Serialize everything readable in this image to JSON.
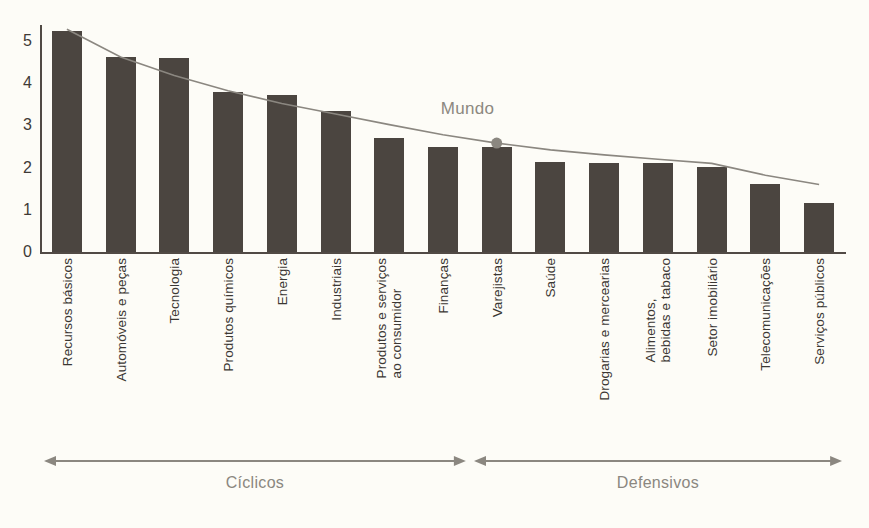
{
  "chart_data": {
    "type": "bar",
    "title": "",
    "subtitle": "",
    "xlabel": "",
    "ylabel": "",
    "ylim": [
      0,
      5.4
    ],
    "yticks": [
      "0",
      "1",
      "2",
      "3",
      "4",
      "5"
    ],
    "ytick_values": [
      0,
      1,
      2,
      3,
      4,
      5
    ],
    "grid": false,
    "legend_position": "inline-annotation",
    "categories": [
      "Recursos básicos",
      "Automóveis e peças",
      "Tecnologia",
      "Produtos químicos",
      "Energia",
      "Industriais",
      "Produtos e serviços\nao consumidor",
      "Finanças",
      "Varejistas",
      "Saúde",
      "Drogarias e mercearias",
      "Alimentos,\nbebidas e tabaco",
      "Setor imobiliário",
      "Telecomunicações",
      "Serviços públicos"
    ],
    "values": [
      5.24,
      4.62,
      4.6,
      3.8,
      3.72,
      3.35,
      2.7,
      2.5,
      2.48,
      2.13,
      2.12,
      2.1,
      2.02,
      1.6,
      1.17
    ],
    "series": [
      {
        "name": "Setores",
        "type": "bar",
        "values": [
          5.24,
          4.62,
          4.6,
          3.8,
          3.72,
          3.35,
          2.7,
          2.5,
          2.48,
          2.13,
          2.12,
          2.1,
          2.02,
          1.6,
          1.17
        ]
      },
      {
        "name": "Mundo",
        "type": "line",
        "values": [
          5.28,
          4.62,
          4.18,
          3.82,
          3.52,
          3.27,
          3.02,
          2.78,
          2.58,
          2.42,
          2.3,
          2.2,
          2.1,
          1.82,
          1.6
        ]
      }
    ],
    "annotations": [
      {
        "text": "Mundo",
        "at_category": "Varejistas",
        "at_value": 2.58
      }
    ],
    "groups": [
      {
        "label": "Cíclicos",
        "from": "Recursos básicos",
        "to": "Finanças"
      },
      {
        "label": "Defensivos",
        "from": "Varejistas",
        "to": "Serviços públicos"
      }
    ]
  },
  "colors": {
    "background": "#fdfcf7",
    "bar": "#4b4540",
    "axis": "#514a45",
    "trend_line": "#8b8780",
    "marker": "#8b8780",
    "annotation_text": "#8c8880",
    "tick_text": "#3f3a36",
    "category_text": "#3b3733",
    "group_text": "#8b8780"
  }
}
